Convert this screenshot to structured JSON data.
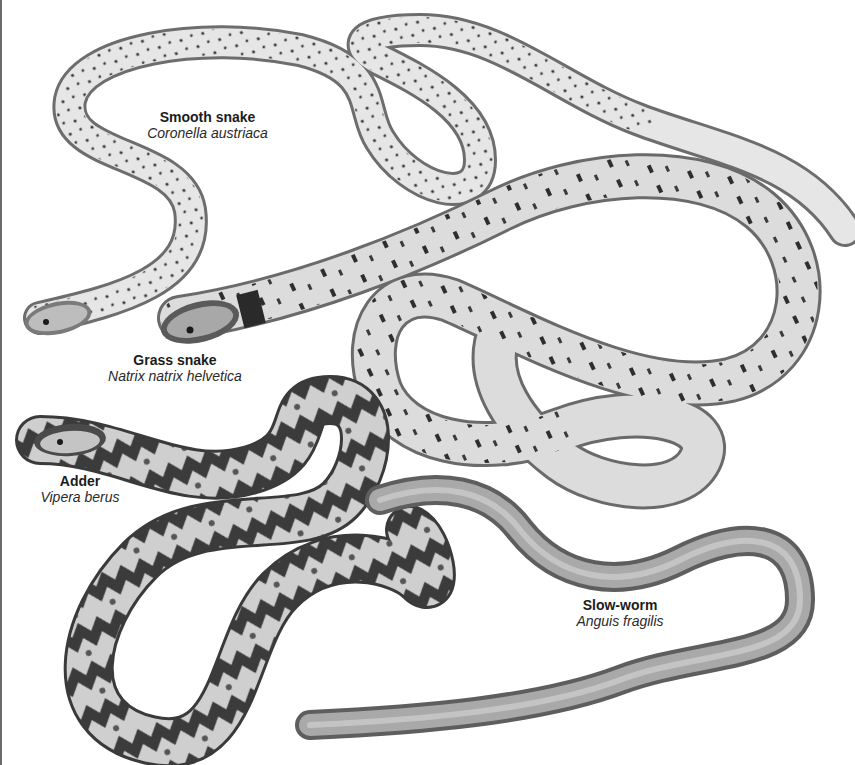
{
  "illustration": {
    "background": "#ffffff",
    "ink": "#1c1c1c",
    "species": [
      {
        "id": "smooth-snake",
        "common_name": "Smooth snake",
        "latin_name": "Coronella austriaca"
      },
      {
        "id": "grass-snake",
        "common_name": "Grass snake",
        "latin_name": "Natrix natrix helvetica"
      },
      {
        "id": "adder",
        "common_name": "Adder",
        "latin_name": "Vipera berus"
      },
      {
        "id": "slow-worm",
        "common_name": "Slow-worm",
        "latin_name": "Anguis fragilis"
      }
    ]
  }
}
